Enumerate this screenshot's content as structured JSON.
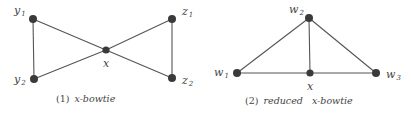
{
  "figures": [
    {
      "id": "x-bowtie",
      "caption": {
        "number": "(1)",
        "text": "x-bowtie"
      },
      "nodes": [
        {
          "id": "y1",
          "base": "y",
          "sub": "1",
          "x": 33,
          "y": 19
        },
        {
          "id": "y2",
          "base": "y",
          "sub": "2",
          "x": 34,
          "y": 79
        },
        {
          "id": "x",
          "base": "x",
          "sub": "",
          "x": 106,
          "y": 50
        },
        {
          "id": "z1",
          "base": "z",
          "sub": "1",
          "x": 172,
          "y": 19
        },
        {
          "id": "z2",
          "base": "z",
          "sub": "2",
          "x": 172,
          "y": 78
        }
      ],
      "edges": [
        [
          "y1",
          "y2"
        ],
        [
          "y1",
          "x"
        ],
        [
          "y2",
          "x"
        ],
        [
          "x",
          "z1"
        ],
        [
          "x",
          "z2"
        ],
        [
          "z1",
          "z2"
        ]
      ]
    },
    {
      "id": "reduced-x-bowtie",
      "caption": {
        "number": "(2)",
        "text": "reduced   x-bowtie"
      },
      "nodes": [
        {
          "id": "w2",
          "base": "w",
          "sub": "2",
          "x": 309,
          "y": 18
        },
        {
          "id": "w1",
          "base": "w",
          "sub": "1",
          "x": 237,
          "y": 73
        },
        {
          "id": "x",
          "base": "x",
          "sub": "",
          "x": 310,
          "y": 73
        },
        {
          "id": "w3",
          "base": "w",
          "sub": "3",
          "x": 376,
          "y": 73
        }
      ],
      "edges": [
        [
          "w2",
          "w1"
        ],
        [
          "w2",
          "x"
        ],
        [
          "w2",
          "w3"
        ],
        [
          "w1",
          "x"
        ],
        [
          "x",
          "w3"
        ]
      ]
    }
  ],
  "colors": {
    "node": "#3a3a3a",
    "edge": "#555555",
    "text": "#444444"
  }
}
